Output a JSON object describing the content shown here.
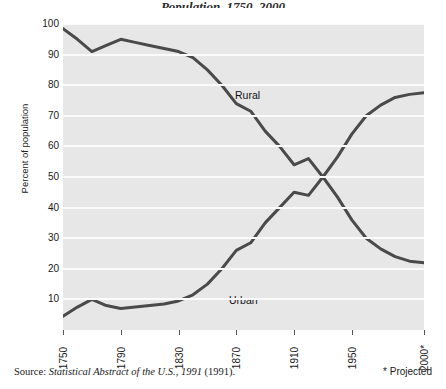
{
  "figure": {
    "title_fragment": "Population, 1750–2000",
    "source_note_prefix": "Source:",
    "source_note_italic": "Statistical Abstract of the U.S., 1991",
    "source_note_suffix": "(1991).",
    "projected_note": "* Projected"
  },
  "chart_data": {
    "type": "line",
    "title": "",
    "xlabel": "",
    "ylabel": "Percent of population",
    "ylim": [
      0,
      100
    ],
    "ytick_values": [
      10,
      20,
      30,
      40,
      50,
      60,
      70,
      80,
      90,
      100
    ],
    "ytick_labels": [
      "10",
      "20",
      "30",
      "40",
      "50",
      "60",
      "70",
      "80",
      "90",
      "100"
    ],
    "grid": true,
    "grid_color": "#fbfbfb",
    "plot_background": "#e7e7e7",
    "line_color": "#4a4a4a",
    "legend_position": "inline-labels",
    "x": [
      1750,
      1760,
      1770,
      1780,
      1790,
      1800,
      1810,
      1820,
      1830,
      1840,
      1850,
      1860,
      1870,
      1880,
      1890,
      1900,
      1910,
      1920,
      1930,
      1940,
      1950,
      1960,
      1970,
      1980,
      1990,
      2000
    ],
    "xtick_values": [
      1750,
      1790,
      1830,
      1870,
      1910,
      1950,
      2000
    ],
    "xtick_labels": [
      "1750",
      "1790",
      "1830",
      "1870",
      "1910",
      "1950",
      "2000*"
    ],
    "series": [
      {
        "name": "Rural",
        "label": "Rural",
        "values": [
          98.5,
          95.0,
          91.0,
          93.0,
          95.0,
          94.0,
          93.0,
          92.0,
          91.0,
          89.0,
          85.0,
          80.0,
          74.0,
          71.5,
          65.0,
          60.0,
          54.0,
          56.0,
          50.0,
          43.5,
          36.0,
          30.0,
          26.5,
          24.0,
          22.5,
          22.0
        ]
      },
      {
        "name": "Urban",
        "label": "Urban",
        "values": [
          4.5,
          7.5,
          10.0,
          8.0,
          7.0,
          7.5,
          8.0,
          8.5,
          9.5,
          11.5,
          15.0,
          20.0,
          26.0,
          28.5,
          35.0,
          40.0,
          45.0,
          44.0,
          50.0,
          56.5,
          64.0,
          70.0,
          73.5,
          76.0,
          77.0,
          77.5
        ]
      }
    ]
  }
}
